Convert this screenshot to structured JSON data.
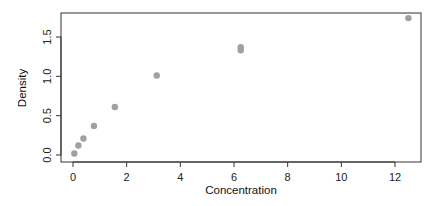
{
  "chart_data": {
    "type": "scatter",
    "title": "",
    "xlabel": "Concentration",
    "ylabel": "Density",
    "xlim": [
      -0.5,
      13.0
    ],
    "ylim": [
      -0.07,
      1.8
    ],
    "x_ticks": [
      0,
      2,
      4,
      6,
      8,
      10,
      12
    ],
    "x_tick_labels": [
      "0",
      "2",
      "4",
      "6",
      "8",
      "10",
      "12"
    ],
    "y_ticks": [
      0.0,
      0.5,
      1.0,
      1.5
    ],
    "y_tick_labels": [
      "0.0",
      "0.5",
      "1.0",
      "1.5"
    ],
    "grid": false,
    "legend": null,
    "point_color": "#a0a0a0",
    "series": [
      {
        "name": "Density",
        "x": [
          0.05,
          0.2,
          0.39,
          0.78,
          1.56,
          3.12,
          6.25,
          6.25,
          12.5
        ],
        "y": [
          0.02,
          0.12,
          0.21,
          0.37,
          0.61,
          1.01,
          1.33,
          1.37,
          1.74
        ]
      }
    ]
  }
}
